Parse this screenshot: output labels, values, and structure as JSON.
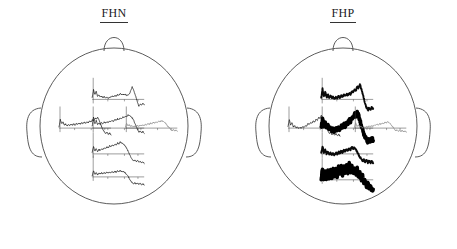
{
  "figure": {
    "type": "erp-topographic-head-maps",
    "panels": [
      {
        "id": "fhn",
        "title": "FHN"
      },
      {
        "id": "fhp",
        "title": "FHP"
      }
    ]
  },
  "chart_data": {
    "type": "line",
    "xlabel": "",
    "ylabel": "",
    "grid": false,
    "legend": "none",
    "note": "Each miniature plot is an averaged ERP waveform drawn on a vertical amplitude axis and a horizontal time (baseline) axis, positioned at its electrode location on a schematic head (nose up, ears at sides).",
    "panels": [
      {
        "name": "FHN",
        "sites": [
          {
            "site": "frontal",
            "x": 0.5,
            "y": 0.3,
            "weight": "thin",
            "color": "#1a1a1a",
            "values": [
              0.1,
              0.62,
              0.3,
              0.52,
              0.22,
              0.28,
              0.16,
              0.2,
              0.12,
              0.18,
              0.1,
              0.14,
              0.08,
              0.12,
              0.16,
              0.22,
              0.18,
              0.26,
              0.2,
              0.3,
              0.26,
              0.38,
              0.3,
              0.34,
              0.28,
              0.32,
              0.26,
              0.3,
              0.36,
              0.58,
              0.8,
              0.62,
              0.34,
              0.1,
              -0.2,
              -0.46,
              -0.3,
              -0.38,
              -0.26,
              -0.34
            ]
          },
          {
            "site": "left-temporal",
            "x": 0.22,
            "y": 0.5,
            "weight": "thin",
            "color": "#1a1a1a",
            "values": [
              0.05,
              0.55,
              0.28,
              0.4,
              0.2,
              0.26,
              0.14,
              0.22,
              0.16,
              0.24,
              0.18,
              0.26,
              0.2,
              0.28,
              0.24,
              0.3,
              0.26,
              0.34,
              0.3,
              0.36,
              0.32,
              0.4,
              0.36,
              0.44,
              0.4,
              0.52,
              0.46,
              0.64,
              0.58,
              0.7,
              0.52,
              0.3,
              0.08,
              -0.1,
              -0.24,
              -0.34,
              -0.28,
              -0.4,
              -0.32,
              -0.44
            ]
          },
          {
            "site": "central",
            "x": 0.5,
            "y": 0.5,
            "weight": "thin",
            "color": "#1a1a1a",
            "values": [
              0.12,
              0.7,
              0.26,
              0.5,
              0.22,
              0.34,
              0.24,
              0.36,
              0.28,
              0.38,
              0.32,
              0.42,
              0.36,
              0.46,
              0.4,
              0.5,
              0.44,
              0.56,
              0.48,
              0.6,
              0.54,
              0.66,
              0.6,
              0.72,
              0.66,
              0.78,
              0.72,
              0.86,
              0.8,
              0.74,
              0.66,
              0.54,
              0.3,
              0.12,
              -0.08,
              -0.26,
              -0.18,
              -0.3,
              -0.22,
              -0.34
            ]
          },
          {
            "site": "right-temporal",
            "x": 0.78,
            "y": 0.5,
            "weight": "thin",
            "color": "#8a8a8a",
            "values": [
              0.04,
              0.3,
              0.14,
              0.22,
              0.1,
              0.16,
              0.08,
              0.14,
              0.1,
              0.16,
              0.12,
              0.18,
              0.14,
              0.2,
              0.16,
              0.24,
              0.2,
              0.28,
              0.24,
              0.32,
              0.28,
              0.36,
              0.32,
              0.4,
              0.36,
              0.44,
              0.4,
              0.48,
              0.44,
              0.4,
              0.34,
              0.22,
              0.1,
              0.02,
              -0.08,
              -0.16,
              -0.1,
              -0.18,
              -0.12,
              -0.2
            ]
          },
          {
            "site": "parietal",
            "x": 0.5,
            "y": 0.68,
            "weight": "thin",
            "color": "#1a1a1a",
            "values": [
              0.08,
              0.48,
              0.18,
              0.34,
              0.16,
              0.28,
              0.22,
              0.34,
              0.28,
              0.4,
              0.34,
              0.46,
              0.4,
              0.52,
              0.46,
              0.58,
              0.52,
              0.64,
              0.58,
              0.7,
              0.64,
              0.76,
              0.7,
              0.66,
              0.58,
              0.48,
              0.34,
              0.16,
              -0.04,
              -0.22,
              -0.34,
              -0.46,
              -0.38,
              -0.5,
              -0.42,
              -0.54,
              -0.46,
              -0.58,
              -0.5,
              -0.62
            ]
          },
          {
            "site": "occipital",
            "x": 0.5,
            "y": 0.84,
            "weight": "thin",
            "color": "#1a1a1a",
            "values": [
              0.06,
              0.4,
              0.16,
              0.28,
              0.14,
              0.24,
              0.18,
              0.26,
              0.2,
              0.28,
              0.22,
              0.3,
              0.24,
              0.32,
              0.26,
              0.34,
              0.28,
              0.36,
              0.3,
              0.38,
              0.32,
              0.4,
              0.34,
              0.36,
              0.3,
              0.24,
              0.14,
              0.02,
              -0.14,
              -0.28,
              -0.36,
              -0.44,
              -0.38,
              -0.46,
              -0.4,
              -0.48,
              -0.42,
              -0.5,
              -0.44,
              -0.52
            ]
          }
        ]
      },
      {
        "name": "FHP",
        "sites": [
          {
            "site": "frontal",
            "x": 0.5,
            "y": 0.3,
            "weight": "thick",
            "color": "#0a0a0a",
            "values": [
              0.08,
              0.66,
              0.22,
              0.46,
              0.14,
              0.3,
              0.1,
              0.22,
              0.08,
              0.18,
              0.06,
              0.16,
              0.1,
              0.2,
              0.14,
              0.24,
              0.18,
              0.3,
              0.22,
              0.34,
              0.26,
              0.38,
              0.34,
              0.5,
              0.44,
              0.62,
              0.56,
              0.8,
              0.72,
              0.96,
              0.7,
              0.4,
              0.06,
              -0.26,
              -0.52,
              -0.7,
              -0.54,
              -0.66,
              -0.46,
              -0.6
            ]
          },
          {
            "site": "left-temporal",
            "x": 0.22,
            "y": 0.5,
            "weight": "thin",
            "color": "#1a1a1a",
            "values": [
              0.1,
              0.52,
              0.2,
              0.34,
              0.08,
              0.16,
              0.02,
              0.08,
              -0.02,
              0.04,
              0.0,
              0.08,
              0.06,
              0.16,
              0.14,
              0.28,
              0.22,
              0.38,
              0.3,
              0.46,
              0.38,
              0.56,
              0.48,
              0.7,
              0.62,
              0.8,
              0.66,
              0.44,
              0.2,
              0.0,
              -0.18,
              -0.34,
              -0.26,
              -0.42,
              -0.32,
              -0.46,
              -0.36,
              -0.5,
              -0.38,
              -0.52
            ]
          },
          {
            "site": "central",
            "x": 0.5,
            "y": 0.5,
            "weight": "very-thick",
            "color": "#000000",
            "values": [
              0.06,
              0.58,
              0.14,
              0.34,
              0.02,
              0.18,
              -0.08,
              0.04,
              -0.16,
              -0.02,
              -0.2,
              -0.06,
              -0.16,
              0.02,
              -0.08,
              0.12,
              0.02,
              0.24,
              0.14,
              0.38,
              0.28,
              0.54,
              0.44,
              0.72,
              0.62,
              0.9,
              0.78,
              1.0,
              0.8,
              0.5,
              0.2,
              -0.1,
              -0.36,
              -0.58,
              -0.74,
              -0.88,
              -0.72,
              -0.84,
              -0.66,
              -0.8
            ]
          },
          {
            "site": "right-temporal",
            "x": 0.78,
            "y": 0.5,
            "weight": "thin",
            "color": "#8a8a8a",
            "values": [
              0.05,
              0.34,
              0.12,
              0.2,
              0.06,
              0.12,
              0.02,
              0.08,
              0.04,
              0.1,
              0.06,
              0.12,
              0.08,
              0.16,
              0.12,
              0.2,
              0.16,
              0.26,
              0.2,
              0.3,
              0.24,
              0.34,
              0.28,
              0.38,
              0.32,
              0.42,
              0.34,
              0.28,
              0.18,
              0.06,
              -0.06,
              -0.16,
              -0.1,
              -0.2,
              -0.14,
              -0.22,
              -0.16,
              -0.24,
              -0.18,
              -0.26
            ]
          },
          {
            "site": "parietal",
            "x": 0.5,
            "y": 0.68,
            "weight": "thick",
            "color": "#0a0a0a",
            "values": [
              0.08,
              0.46,
              0.1,
              0.26,
              0.02,
              0.14,
              -0.04,
              0.06,
              -0.08,
              0.04,
              -0.06,
              0.08,
              -0.02,
              0.12,
              0.04,
              0.18,
              0.1,
              0.24,
              0.16,
              0.3,
              0.22,
              0.36,
              0.28,
              0.44,
              0.34,
              0.38,
              0.26,
              0.12,
              -0.04,
              -0.2,
              -0.34,
              -0.46,
              -0.38,
              -0.5,
              -0.42,
              -0.54,
              -0.46,
              -0.58,
              -0.48,
              -0.6
            ]
          },
          {
            "site": "occipital",
            "x": 0.5,
            "y": 0.86,
            "weight": "very-thick",
            "color": "#000000",
            "values": [
              0.04,
              0.7,
              0.1,
              0.52,
              0.06,
              0.6,
              0.12,
              0.66,
              0.16,
              0.72,
              0.2,
              0.78,
              0.24,
              0.84,
              0.3,
              0.9,
              0.36,
              0.94,
              0.4,
              0.98,
              0.44,
              1.0,
              0.46,
              0.96,
              0.4,
              0.84,
              0.3,
              0.7,
              0.16,
              0.5,
              0.0,
              0.26,
              -0.2,
              0.0,
              -0.4,
              -0.24,
              -0.56,
              -0.44,
              -0.7,
              -0.6
            ]
          }
        ]
      }
    ]
  },
  "style": {
    "head_outline_color": "#4a4a4a",
    "axis_color": "#3a3a3a",
    "background": "#ffffff",
    "title_color": "#1a1a1a"
  }
}
